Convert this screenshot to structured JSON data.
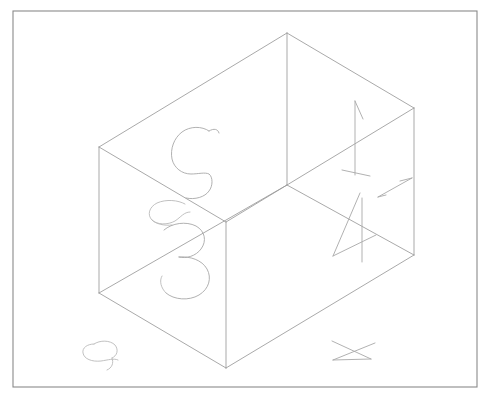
{
  "canvas": {
    "width": 490,
    "height": 402,
    "background_color": "#ffffff",
    "title": "Isometric wireframe box sketch"
  },
  "frame": {
    "name": "border-frame",
    "x": 13,
    "y": 11,
    "width": 464,
    "height": 376,
    "stroke_color": "#8a8a8a",
    "fill_color": "#ffffff",
    "stroke_width": 1.1
  },
  "figure": {
    "type": "wireframe-cuboid",
    "stroke_color": "#9a9a9a",
    "stroke_width": 0.85,
    "vertices": {
      "top_back": [
        287,
        33
      ],
      "top_left": [
        99,
        147
      ],
      "top_right": [
        414,
        108
      ],
      "top_front": [
        226,
        222
      ],
      "bottom_left": [
        99,
        293
      ],
      "bottom_right": [
        414,
        255
      ],
      "bottom_front": [
        226,
        368
      ]
    },
    "edges": [
      {
        "name": "top-back-to-top-left",
        "from": [
          287,
          33
        ],
        "to": [
          99,
          147
        ]
      },
      {
        "name": "top-back-to-top-right",
        "from": [
          287,
          33
        ],
        "to": [
          414,
          108
        ]
      },
      {
        "name": "top-left-to-top-front",
        "from": [
          99,
          147
        ],
        "to": [
          226,
          222
        ]
      },
      {
        "name": "top-right-to-top-front",
        "from": [
          414,
          108
        ],
        "to": [
          226,
          222
        ]
      },
      {
        "name": "vertical-left",
        "from": [
          99,
          147
        ],
        "to": [
          99,
          293
        ]
      },
      {
        "name": "vertical-right",
        "from": [
          414,
          108
        ],
        "to": [
          414,
          255
        ]
      },
      {
        "name": "vertical-front",
        "from": [
          226,
          222
        ],
        "to": [
          226,
          368
        ]
      },
      {
        "name": "vertical-back",
        "from": [
          287,
          33
        ],
        "to": [
          287,
          185
        ]
      },
      {
        "name": "bottom-left-to-bottom-front",
        "from": [
          99,
          293
        ],
        "to": [
          226,
          368
        ]
      },
      {
        "name": "bottom-right-to-bottom-front",
        "from": [
          414,
          255
        ],
        "to": [
          226,
          368
        ]
      }
    ]
  },
  "annotations": [
    {
      "name": "digit-5-mark",
      "label": "5",
      "position": [
        180,
        160
      ],
      "description": "Hand-drawn digit five sketched on the upper left face"
    },
    {
      "name": "digit-3-mark",
      "label": "3",
      "position": [
        180,
        255
      ],
      "description": "Hand-drawn digit three sketched on the lower left face"
    },
    {
      "name": "digit-1-mark",
      "label": "1",
      "position": [
        358,
        140
      ],
      "description": "Hand-drawn digit one sketched on the upper right face"
    },
    {
      "name": "digit-4-mark",
      "label": "4",
      "position": [
        355,
        225
      ],
      "description": "Hand-drawn digit four sketched on the lower right face"
    },
    {
      "name": "arrow-mark-right",
      "label": "arrow",
      "position": [
        398,
        182
      ],
      "description": "Small arrow stroke near the right edge"
    },
    {
      "name": "squiggle-mark-bottom-left",
      "label": "squiggle",
      "position": [
        100,
        352
      ],
      "description": "Small hand-drawn squiggle at the lower left"
    },
    {
      "name": "arrowhead-mark-bottom-right",
      "label": "arrowhead",
      "position": [
        355,
        350
      ],
      "description": "Small arrowhead / triangular mark at the lower right"
    }
  ],
  "colors": {
    "frame_stroke": "#8a8a8a",
    "box_stroke": "#9a9a9a",
    "sketch_stroke": "#a8a8a8",
    "sketch_stroke_faint": "#b6b6b6",
    "background": "#ffffff"
  }
}
